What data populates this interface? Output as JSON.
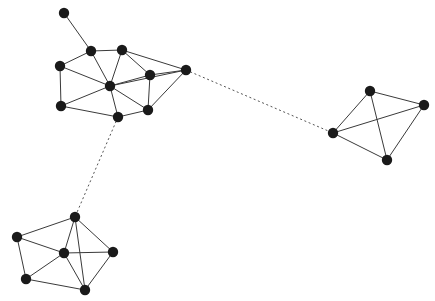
{
  "figure": {
    "type": "network-graph",
    "title": "",
    "background_color": "#ffffff",
    "node_color": "#1a1a1a",
    "edge_color": "#3a3a3a",
    "bridge_edge_color": "#555555",
    "node_radius": 5.2,
    "width": 435,
    "height": 301
  },
  "chart_data": {
    "type": "scatter",
    "title": "",
    "xlabel": "",
    "ylabel": "",
    "layout": "node-link diagram, three communities joined by dotted bridge edges",
    "legend": [],
    "grid": false,
    "communities": [
      {
        "id": "cluster-top-left",
        "label": "",
        "node_ids": [
          "n0",
          "n1",
          "n2",
          "n3",
          "n4",
          "n5",
          "n6",
          "n7",
          "n8",
          "n9"
        ]
      },
      {
        "id": "cluster-bottom-left",
        "label": "",
        "node_ids": [
          "n10",
          "n11",
          "n12",
          "n13",
          "n14",
          "n15"
        ]
      },
      {
        "id": "cluster-right",
        "label": "",
        "node_ids": [
          "n16",
          "n17",
          "n18",
          "n19"
        ]
      }
    ],
    "nodes": [
      {
        "id": "n0",
        "x": 64,
        "y": 13,
        "community": "cluster-top-left"
      },
      {
        "id": "n1",
        "x": 91,
        "y": 51,
        "community": "cluster-top-left"
      },
      {
        "id": "n2",
        "x": 122,
        "y": 50,
        "community": "cluster-top-left"
      },
      {
        "id": "n3",
        "x": 60,
        "y": 66,
        "community": "cluster-top-left"
      },
      {
        "id": "n4",
        "x": 110,
        "y": 86,
        "community": "cluster-top-left"
      },
      {
        "id": "n5",
        "x": 150,
        "y": 75,
        "community": "cluster-top-left"
      },
      {
        "id": "n6",
        "x": 186,
        "y": 70,
        "community": "cluster-top-left"
      },
      {
        "id": "n7",
        "x": 61,
        "y": 106,
        "community": "cluster-top-left"
      },
      {
        "id": "n8",
        "x": 118,
        "y": 117,
        "community": "cluster-top-left"
      },
      {
        "id": "n9",
        "x": 148,
        "y": 110,
        "community": "cluster-top-left"
      },
      {
        "id": "n10",
        "x": 75,
        "y": 217,
        "community": "cluster-bottom-left"
      },
      {
        "id": "n11",
        "x": 17,
        "y": 237,
        "community": "cluster-bottom-left"
      },
      {
        "id": "n12",
        "x": 64,
        "y": 253,
        "community": "cluster-bottom-left"
      },
      {
        "id": "n13",
        "x": 113,
        "y": 252,
        "community": "cluster-bottom-left"
      },
      {
        "id": "n14",
        "x": 26,
        "y": 279,
        "community": "cluster-bottom-left"
      },
      {
        "id": "n15",
        "x": 85,
        "y": 290,
        "community": "cluster-bottom-left"
      },
      {
        "id": "n16",
        "x": 370,
        "y": 91,
        "community": "cluster-right"
      },
      {
        "id": "n17",
        "x": 424,
        "y": 105,
        "community": "cluster-right"
      },
      {
        "id": "n18",
        "x": 333,
        "y": 133,
        "community": "cluster-right"
      },
      {
        "id": "n19",
        "x": 387,
        "y": 160,
        "community": "cluster-right"
      }
    ],
    "edges": [
      {
        "source": "n0",
        "target": "n1",
        "style": "solid"
      },
      {
        "source": "n1",
        "target": "n2",
        "style": "solid"
      },
      {
        "source": "n1",
        "target": "n3",
        "style": "solid"
      },
      {
        "source": "n1",
        "target": "n4",
        "style": "solid"
      },
      {
        "source": "n2",
        "target": "n4",
        "style": "solid"
      },
      {
        "source": "n2",
        "target": "n5",
        "style": "solid"
      },
      {
        "source": "n2",
        "target": "n6",
        "style": "solid"
      },
      {
        "source": "n3",
        "target": "n4",
        "style": "solid"
      },
      {
        "source": "n3",
        "target": "n7",
        "style": "solid"
      },
      {
        "source": "n4",
        "target": "n5",
        "style": "solid"
      },
      {
        "source": "n4",
        "target": "n6",
        "style": "solid"
      },
      {
        "source": "n4",
        "target": "n7",
        "style": "solid"
      },
      {
        "source": "n4",
        "target": "n8",
        "style": "solid"
      },
      {
        "source": "n4",
        "target": "n9",
        "style": "solid"
      },
      {
        "source": "n5",
        "target": "n6",
        "style": "solid"
      },
      {
        "source": "n5",
        "target": "n9",
        "style": "solid"
      },
      {
        "source": "n6",
        "target": "n9",
        "style": "solid"
      },
      {
        "source": "n7",
        "target": "n8",
        "style": "solid"
      },
      {
        "source": "n8",
        "target": "n9",
        "style": "solid"
      },
      {
        "source": "n10",
        "target": "n11",
        "style": "solid"
      },
      {
        "source": "n10",
        "target": "n12",
        "style": "solid"
      },
      {
        "source": "n10",
        "target": "n13",
        "style": "solid"
      },
      {
        "source": "n10",
        "target": "n15",
        "style": "solid"
      },
      {
        "source": "n11",
        "target": "n12",
        "style": "solid"
      },
      {
        "source": "n11",
        "target": "n14",
        "style": "solid"
      },
      {
        "source": "n12",
        "target": "n13",
        "style": "solid"
      },
      {
        "source": "n12",
        "target": "n14",
        "style": "solid"
      },
      {
        "source": "n12",
        "target": "n15",
        "style": "solid"
      },
      {
        "source": "n13",
        "target": "n15",
        "style": "solid"
      },
      {
        "source": "n14",
        "target": "n15",
        "style": "solid"
      },
      {
        "source": "n16",
        "target": "n17",
        "style": "solid"
      },
      {
        "source": "n16",
        "target": "n18",
        "style": "solid"
      },
      {
        "source": "n16",
        "target": "n19",
        "style": "solid"
      },
      {
        "source": "n17",
        "target": "n18",
        "style": "solid"
      },
      {
        "source": "n17",
        "target": "n19",
        "style": "solid"
      },
      {
        "source": "n18",
        "target": "n19",
        "style": "solid"
      },
      {
        "source": "n6",
        "target": "n18",
        "style": "dotted"
      },
      {
        "source": "n8",
        "target": "n10",
        "style": "dotted"
      }
    ],
    "summary": {
      "node_count": 20,
      "edge_count": 38,
      "community_count": 3,
      "bridge_edge_count": 2
    }
  }
}
